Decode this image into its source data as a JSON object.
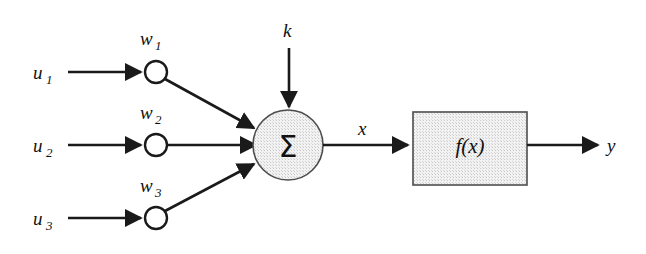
{
  "diagram": {
    "background_color": "#ffffff",
    "line_color": "#1a1a1a",
    "shade_color": "#ececec",
    "inputs": [
      {
        "signal": "u",
        "signal_sub": "1",
        "weight": "w",
        "weight_sub": "1"
      },
      {
        "signal": "u",
        "signal_sub": "2",
        "weight": "w",
        "weight_sub": "2"
      },
      {
        "signal": "u",
        "signal_sub": "3",
        "weight": "w",
        "weight_sub": "3"
      }
    ],
    "bias_label": "k",
    "summation_symbol": "Σ",
    "net_input_label": "x",
    "activation_label": "f(x)",
    "output_label": "y"
  }
}
